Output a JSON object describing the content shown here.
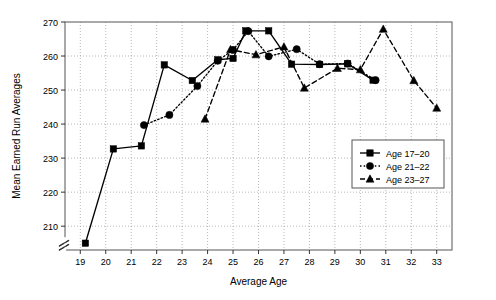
{
  "chart_data": {
    "type": "line",
    "title": "",
    "xlabel": "Average Age",
    "ylabel": "Mean Earned Run Averages",
    "xlim": [
      18.4,
      33.6
    ],
    "ylim": [
      203.0,
      270.0
    ],
    "yticks": [
      210,
      220,
      230,
      240,
      250,
      260,
      270
    ],
    "xticks": [
      19,
      20,
      21,
      22,
      23,
      24,
      25,
      26,
      27,
      28,
      29,
      30,
      31,
      32,
      33
    ],
    "y_axis_break": true,
    "y_axis_break_below": 210,
    "grid": true,
    "grid_style": "dotted",
    "legend_position": "lower right",
    "series": [
      {
        "name": "Age 17–20",
        "marker": "square",
        "linestyle": "solid",
        "color": "#000000",
        "points": [
          {
            "x": 19.2,
            "y": 205.0
          },
          {
            "x": 20.3,
            "y": 232.7
          },
          {
            "x": 21.4,
            "y": 233.6
          },
          {
            "x": 22.3,
            "y": 257.4
          },
          {
            "x": 23.4,
            "y": 252.8
          },
          {
            "x": 24.4,
            "y": 258.9
          },
          {
            "x": 25.0,
            "y": 259.3
          },
          {
            "x": 25.5,
            "y": 267.4
          },
          {
            "x": 26.4,
            "y": 267.4
          },
          {
            "x": 27.3,
            "y": 257.6
          },
          {
            "x": 28.4,
            "y": 257.5
          },
          {
            "x": 29.5,
            "y": 257.7
          },
          {
            "x": 30.5,
            "y": 252.9
          }
        ]
      },
      {
        "name": "Age 21–22",
        "marker": "circle",
        "linestyle": "dotted",
        "color": "#000000",
        "points": [
          {
            "x": 21.5,
            "y": 239.7
          },
          {
            "x": 22.5,
            "y": 242.7
          },
          {
            "x": 23.6,
            "y": 251.2
          },
          {
            "x": 24.4,
            "y": 258.6
          },
          {
            "x": 25.0,
            "y": 261.8
          },
          {
            "x": 25.6,
            "y": 267.3
          },
          {
            "x": 26.4,
            "y": 259.9
          },
          {
            "x": 27.5,
            "y": 262.0
          },
          {
            "x": 28.4,
            "y": 257.6
          },
          {
            "x": 29.5,
            "y": 257.8
          },
          {
            "x": 30.6,
            "y": 252.9
          }
        ]
      },
      {
        "name": "Age 23–27",
        "marker": "triangle",
        "linestyle": "dashed",
        "color": "#000000",
        "points": [
          {
            "x": 23.9,
            "y": 241.5
          },
          {
            "x": 24.9,
            "y": 261.9
          },
          {
            "x": 25.9,
            "y": 260.4
          },
          {
            "x": 27.0,
            "y": 262.7
          },
          {
            "x": 27.8,
            "y": 250.6
          },
          {
            "x": 29.1,
            "y": 256.4
          },
          {
            "x": 30.0,
            "y": 256.0
          },
          {
            "x": 30.9,
            "y": 267.9
          },
          {
            "x": 32.1,
            "y": 252.8
          },
          {
            "x": 33.0,
            "y": 244.7
          }
        ]
      }
    ],
    "legend_entries": [
      {
        "label": "Age 17–20",
        "marker": "square",
        "linestyle": "solid"
      },
      {
        "label": "Age 21–22",
        "marker": "circle",
        "linestyle": "dotted"
      },
      {
        "label": "Age 23–27",
        "marker": "triangle",
        "linestyle": "dashed"
      }
    ]
  }
}
